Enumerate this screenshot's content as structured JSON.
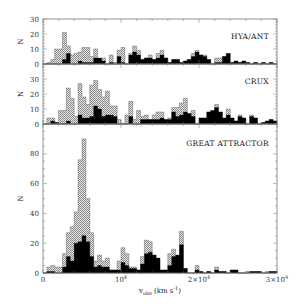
{
  "chart_data": {
    "type": "bar",
    "subtype": "stacked-histogram-panels",
    "xlabel": "v_obs (km s^-1)",
    "xlim": [
      0,
      30000
    ],
    "x_ticks": [
      {
        "value": 0,
        "label": "0"
      },
      {
        "value": 10000,
        "label": "10^4"
      },
      {
        "value": 20000,
        "label": "2×10^4"
      },
      {
        "value": 30000,
        "label": "3×10^4"
      }
    ],
    "bin_width": 500,
    "legend": [
      {
        "name": "all galaxies",
        "style": "hatched"
      },
      {
        "name": "subset",
        "style": "solid black"
      }
    ],
    "panels": [
      {
        "name": "HYA/ANT",
        "ylabel": "N",
        "ylim": [
          0,
          30
        ],
        "y_ticks": [
          0,
          10,
          20,
          30
        ],
        "total": [
          0,
          1,
          3,
          10,
          10,
          21,
          12,
          6,
          7,
          8,
          11,
          11,
          5,
          10,
          2,
          4,
          0,
          6,
          1,
          9,
          11,
          0,
          7,
          12,
          9,
          3,
          4,
          6,
          3,
          7,
          9,
          4,
          1,
          3,
          3,
          1,
          2,
          3,
          7,
          9,
          6,
          6,
          3,
          0,
          4,
          4,
          5,
          7,
          1,
          2,
          1,
          2,
          1,
          0,
          1,
          0,
          1,
          0,
          1,
          0
        ],
        "subset": [
          0,
          0,
          0,
          0,
          0,
          3,
          7,
          0,
          0,
          2,
          1,
          1,
          1,
          4,
          4,
          2,
          0,
          1,
          0,
          5,
          1,
          0,
          6,
          8,
          6,
          3,
          4,
          4,
          3,
          4,
          6,
          4,
          1,
          3,
          3,
          1,
          2,
          3,
          5,
          8,
          6,
          5,
          3,
          0,
          1,
          1,
          5,
          7,
          1,
          2,
          1,
          2,
          1,
          0,
          1,
          0,
          1,
          0,
          1,
          0
        ]
      },
      {
        "name": "CRUX",
        "ylabel": "N",
        "ylim": [
          0,
          40
        ],
        "y_ticks": [
          0,
          10,
          20,
          30
        ],
        "total": [
          0,
          4,
          4,
          1,
          9,
          9,
          24,
          17,
          5,
          27,
          18,
          13,
          26,
          29,
          23,
          18,
          22,
          12,
          12,
          3,
          0,
          6,
          15,
          3,
          9,
          5,
          6,
          3,
          6,
          8,
          8,
          3,
          4,
          11,
          11,
          14,
          17,
          7,
          9,
          0,
          4,
          4,
          8,
          9,
          13,
          8,
          4,
          10,
          4,
          2,
          6,
          4,
          0,
          6,
          4,
          0,
          1,
          2,
          3,
          2
        ],
        "subset": [
          0,
          0,
          2,
          1,
          0,
          0,
          2,
          0,
          0,
          6,
          4,
          4,
          5,
          12,
          10,
          5,
          6,
          6,
          5,
          0,
          0,
          0,
          5,
          0,
          0,
          3,
          3,
          3,
          3,
          3,
          4,
          3,
          3,
          8,
          5,
          6,
          8,
          7,
          5,
          0,
          4,
          4,
          8,
          9,
          11,
          8,
          4,
          6,
          4,
          2,
          5,
          4,
          0,
          5,
          4,
          0,
          1,
          2,
          3,
          2
        ]
      },
      {
        "name": "GREAT ATTRACTOR",
        "ylabel": "N",
        "ylim": [
          0,
          100
        ],
        "y_ticks": [
          0,
          20,
          40,
          60,
          80
        ],
        "total": [
          0,
          4,
          5,
          4,
          4,
          13,
          27,
          31,
          41,
          76,
          90,
          50,
          27,
          8,
          12,
          8,
          10,
          2,
          2,
          8,
          17,
          13,
          4,
          4,
          2,
          11,
          22,
          21,
          12,
          9,
          2,
          2,
          13,
          16,
          11,
          28,
          3,
          0,
          0,
          5,
          1,
          0,
          1,
          0,
          4,
          1,
          1,
          0,
          2,
          2,
          0,
          0,
          1,
          1,
          1,
          1,
          0,
          1,
          1,
          1
        ],
        "subset": [
          0,
          1,
          1,
          0,
          0,
          4,
          11,
          8,
          20,
          21,
          25,
          21,
          11,
          4,
          5,
          4,
          4,
          2,
          2,
          2,
          7,
          5,
          3,
          3,
          2,
          6,
          13,
          14,
          12,
          10,
          2,
          2,
          5,
          11,
          12,
          19,
          3,
          0,
          0,
          2,
          1,
          0,
          1,
          0,
          2,
          1,
          1,
          0,
          2,
          2,
          0,
          0,
          0,
          1,
          1,
          1,
          0,
          0,
          1,
          1
        ]
      }
    ]
  }
}
